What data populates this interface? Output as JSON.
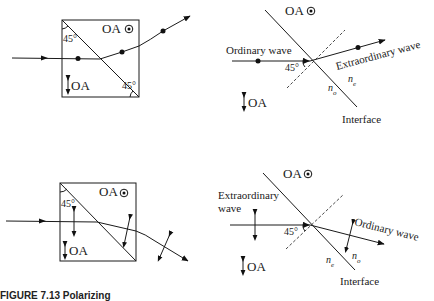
{
  "figure": {
    "caption_partial": "FIGURE 7.13  Polarizing",
    "panels": [
      {
        "id": "top-left",
        "optic_axis_top_label": "OA",
        "optic_axis_bottom_label": "OA",
        "angle_top": "45°",
        "angle_bottom": "45°",
        "polarization": "dots (out of page)"
      },
      {
        "id": "top-right",
        "optic_axis_top_label": "OA",
        "optic_axis_bottom_label": "OA",
        "incoming_label": "Ordinary wave",
        "outgoing_label": "Extraordinary wave",
        "angle": "45°",
        "n_left": "n",
        "n_left_sub": "o",
        "n_right": "n",
        "n_right_sub": "e",
        "interface_label": "Interface"
      },
      {
        "id": "bottom-left",
        "optic_axis_top_label": "OA",
        "optic_axis_bottom_label": "OA",
        "angle_top": "45°",
        "polarization": "arrows (in plane)"
      },
      {
        "id": "bottom-right",
        "optic_axis_top_label": "OA",
        "optic_axis_bottom_label": "OA",
        "incoming_label_line1": "Extraordinary",
        "incoming_label_line2": "wave",
        "outgoing_label": "Ordinary wave",
        "angle": "45°",
        "n_left": "n",
        "n_left_sub": "e",
        "n_right": "n",
        "n_right_sub": "o",
        "interface_label": "Interface"
      }
    ]
  }
}
